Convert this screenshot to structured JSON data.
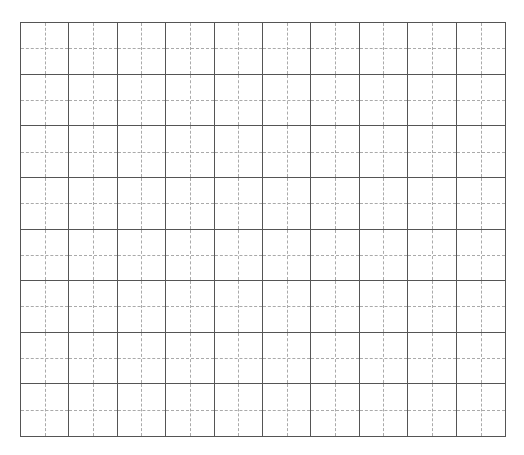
{
  "grid": {
    "type": "tianzige-practice-grid",
    "columns": 10,
    "rows": 8,
    "line_color": "#555555",
    "guide_color": "#aaaaaa",
    "guide_style": "dashed-cross"
  }
}
